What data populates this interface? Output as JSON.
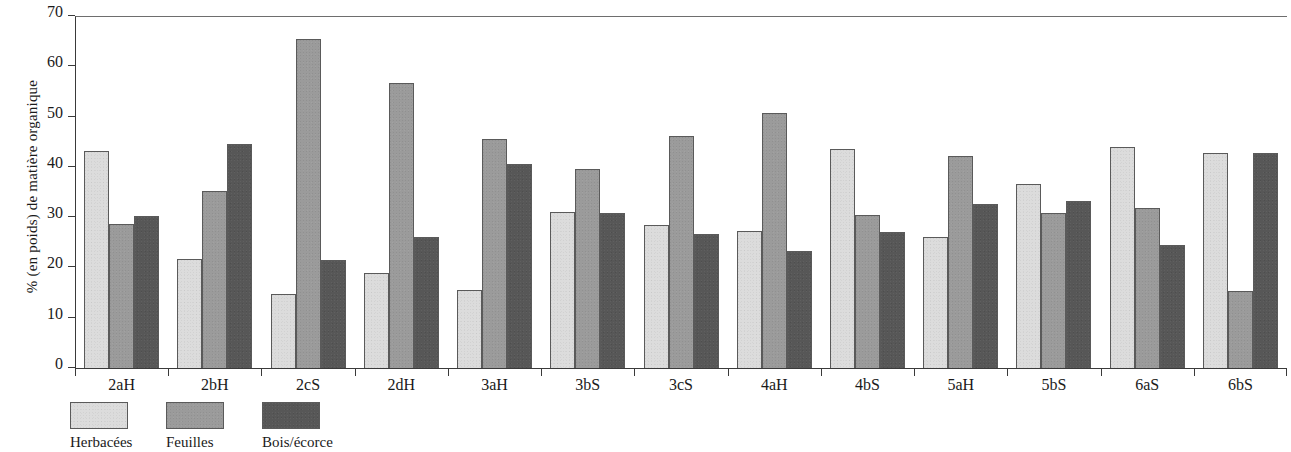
{
  "chart_data": {
    "type": "bar",
    "title": "",
    "subtitle": "",
    "xlabel": "",
    "ylabel": "% (en poids) de matière organique",
    "ylim": [
      0,
      70
    ],
    "ytick_labels": [
      "0",
      "10",
      "20",
      "30",
      "40",
      "50",
      "60",
      "70"
    ],
    "ytick_values": [
      0,
      10,
      20,
      30,
      40,
      50,
      60,
      70
    ],
    "grid": false,
    "legend_position": "bottom-left",
    "orientation": "vertical",
    "grouping": "grouped",
    "categories": [
      "2aH",
      "2bH",
      "2cS",
      "2dH",
      "3aH",
      "3bS",
      "3cS",
      "4aH",
      "4bS",
      "5aH",
      "5bS",
      "6aS",
      "6bS"
    ],
    "series": [
      {
        "name": "Herbacées",
        "color": "#dcdcdc",
        "values": [
          43.2,
          21.6,
          14.8,
          18.8,
          15.5,
          31.1,
          28.5,
          27.3,
          43.6,
          26.0,
          36.5,
          44.0,
          42.7
        ]
      },
      {
        "name": "Feuilles",
        "color": "#9b9b9b",
        "values": [
          28.7,
          35.3,
          65.5,
          56.7,
          45.6,
          39.5,
          46.2,
          50.7,
          30.4,
          42.1,
          30.9,
          31.8,
          15.3
        ]
      },
      {
        "name": "Bois/écorce",
        "color": "#575757",
        "values": [
          30.3,
          44.6,
          21.4,
          26.1,
          40.6,
          30.9,
          26.6,
          23.3,
          27.1,
          32.6,
          33.2,
          24.5,
          42.7
        ]
      }
    ]
  },
  "legend": {
    "items": [
      {
        "label": "Herbacées",
        "swatch": "light-gray-swatch"
      },
      {
        "label": "Feuilles",
        "swatch": "medium-gray-swatch"
      },
      {
        "label": "Bois/écorce",
        "swatch": "dark-gray-swatch"
      }
    ]
  }
}
